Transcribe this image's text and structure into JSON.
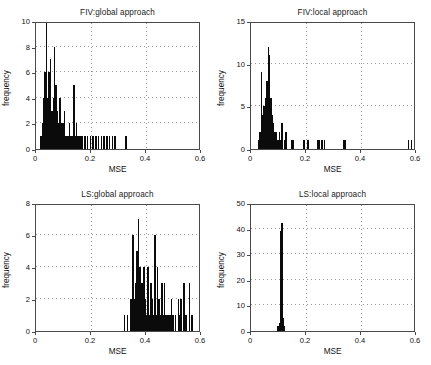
{
  "figure": {
    "background": "#ffffff",
    "bar_color": "#0b0b0b",
    "axis_color": "#4a4a4a",
    "grid_color": "#9a9a9a"
  },
  "axis_titles": {
    "x": "MSE",
    "y": "frequency"
  },
  "chart_data": [
    {
      "type": "bar",
      "id": "fiv-global",
      "title": "FIV:global approach",
      "xlabel": "MSE",
      "ylabel": "frequency",
      "xlim": [
        0,
        0.6
      ],
      "ylim": [
        0,
        10
      ],
      "xticks": [
        0,
        0.2,
        0.4,
        0.6
      ],
      "xticklabels": [
        "0",
        "0.2",
        "0.4",
        "0.6"
      ],
      "yticks": [
        0,
        2,
        4,
        6,
        8,
        10
      ],
      "yticklabels": [
        "0",
        "2",
        "4",
        "6",
        "8",
        "10"
      ],
      "grid": true,
      "legend": "none",
      "bin_width": 0.005,
      "x": [
        0.0175,
        0.0225,
        0.0275,
        0.0325,
        0.0375,
        0.0425,
        0.0475,
        0.0525,
        0.0575,
        0.0625,
        0.0675,
        0.0725,
        0.0775,
        0.0825,
        0.0875,
        0.0925,
        0.0975,
        0.1025,
        0.1075,
        0.1125,
        0.1175,
        0.1225,
        0.1275,
        0.1325,
        0.1375,
        0.1425,
        0.1475,
        0.1525,
        0.1575,
        0.1625,
        0.1675,
        0.1775,
        0.1875,
        0.1975,
        0.2075,
        0.2175,
        0.2275,
        0.2375,
        0.2475,
        0.2575,
        0.2675,
        0.2775,
        0.2875,
        0.3275
      ],
      "values": [
        1,
        2,
        4,
        6,
        10,
        4,
        6,
        7,
        3,
        4,
        8,
        5,
        3,
        2,
        4,
        2,
        2,
        3,
        1,
        1,
        1,
        2,
        1,
        1,
        5,
        1,
        2,
        1,
        1,
        1,
        1,
        1,
        1,
        1,
        1,
        1,
        1,
        1,
        1,
        1,
        1,
        1,
        1,
        1
      ]
    },
    {
      "type": "bar",
      "id": "fiv-local",
      "title": "FIV:local approach",
      "xlabel": "MSE",
      "ylabel": "frequency",
      "xlim": [
        0,
        0.6
      ],
      "ylim": [
        0,
        15
      ],
      "xticks": [
        0,
        0.2,
        0.4,
        0.6
      ],
      "xticklabels": [
        "0",
        "0.2",
        "0.4",
        "0.6"
      ],
      "yticks": [
        0,
        5,
        10,
        15
      ],
      "yticklabels": [
        "0",
        "5",
        "10",
        "15"
      ],
      "grid": true,
      "legend": "none",
      "bin_width": 0.005,
      "x": [
        0.0275,
        0.0325,
        0.0375,
        0.0425,
        0.0475,
        0.0525,
        0.0575,
        0.0625,
        0.0675,
        0.0725,
        0.0775,
        0.0825,
        0.0875,
        0.0925,
        0.0975,
        0.1025,
        0.1075,
        0.1125,
        0.1225,
        0.1275,
        0.1475,
        0.1525,
        0.1925,
        0.2075,
        0.2425,
        0.2475,
        0.2575,
        0.2675,
        0.3375,
        0.3425,
        0.5725,
        0.5825
      ],
      "values": [
        1,
        2,
        9,
        4,
        5,
        6,
        8,
        12,
        11,
        6,
        4,
        3,
        2,
        2,
        1,
        2,
        1,
        3,
        1,
        2,
        1,
        1,
        1,
        1,
        1,
        1,
        1,
        1,
        1,
        1,
        1,
        1
      ]
    },
    {
      "type": "bar",
      "id": "ls-global",
      "title": "LS:global approach",
      "xlabel": "MSE",
      "ylabel": "frequency",
      "xlim": [
        0,
        0.6
      ],
      "ylim": [
        0,
        8
      ],
      "xticks": [
        0,
        0.2,
        0.4,
        0.6
      ],
      "xticklabels": [
        "0",
        "0.2",
        "0.4",
        "0.6"
      ],
      "yticks": [
        0,
        2,
        4,
        6,
        8
      ],
      "yticklabels": [
        "0",
        "2",
        "4",
        "6",
        "8"
      ],
      "grid": true,
      "legend": "none",
      "bin_width": 0.005,
      "x": [
        0.3225,
        0.3325,
        0.3425,
        0.3475,
        0.3525,
        0.3575,
        0.3625,
        0.3675,
        0.3725,
        0.3775,
        0.3825,
        0.3875,
        0.3925,
        0.3975,
        0.4025,
        0.4075,
        0.4125,
        0.4175,
        0.4225,
        0.4275,
        0.4325,
        0.4375,
        0.4425,
        0.4475,
        0.4525,
        0.4575,
        0.4625,
        0.4675,
        0.4725,
        0.4775,
        0.4825,
        0.4875,
        0.4925,
        0.4975,
        0.5075,
        0.5175,
        0.5225,
        0.5275,
        0.5375,
        0.5425,
        0.5475,
        0.5575,
        0.5675
      ],
      "values": [
        1,
        1,
        2,
        2,
        6,
        2,
        3,
        5,
        7,
        4,
        3,
        3,
        4,
        2,
        1,
        4,
        1,
        3,
        2,
        1,
        6,
        1,
        4,
        2,
        1,
        3,
        1,
        3,
        1,
        1,
        1,
        1,
        2,
        1,
        1,
        2,
        1,
        2,
        3,
        1,
        1,
        3,
        1
      ]
    },
    {
      "type": "bar",
      "id": "ls-local",
      "title": "LS:local approach",
      "xlabel": "MSE",
      "ylabel": "frequency",
      "xlim": [
        0,
        0.6
      ],
      "ylim": [
        0,
        50
      ],
      "xticks": [
        0,
        0.2,
        0.4,
        0.6
      ],
      "xticklabels": [
        "0",
        "0.2",
        "0.4",
        "0.6"
      ],
      "yticks": [
        0,
        10,
        20,
        30,
        40,
        50
      ],
      "yticklabels": [
        "0",
        "10",
        "20",
        "30",
        "40",
        "50"
      ],
      "grid": true,
      "legend": "none",
      "bin_width": 0.005,
      "x": [
        0.0975,
        0.1025,
        0.1075,
        0.1125,
        0.1175,
        0.1225
      ],
      "values": [
        2,
        3,
        39,
        42,
        5,
        2
      ]
    }
  ]
}
